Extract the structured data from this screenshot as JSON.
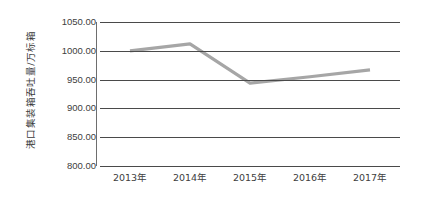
{
  "chart_data": {
    "type": "line",
    "title": "",
    "xlabel": "",
    "ylabel": "港口集装箱吞吐量/万标箱",
    "categories": [
      "2013年",
      "2014年",
      "2015年",
      "2016年",
      "2017年"
    ],
    "series": [
      {
        "name": "港口集装箱吞吐量",
        "values": [
          1000,
          1012,
          944,
          955,
          967
        ]
      }
    ],
    "ylim": [
      800,
      1050
    ],
    "ytick_labels": [
      "1050.00",
      "1000.00",
      "950.00",
      "900.00",
      "850.00",
      "800.00"
    ],
    "ytick_values": [
      1050,
      1000,
      950,
      900,
      850,
      800
    ],
    "grid": true,
    "legend": false,
    "legend_position": "none",
    "colors": {
      "line": "#a6a6a6",
      "gridline": "#4a4a4a",
      "axis": "#6e6e6e",
      "text": "#404040",
      "background": "#ffffff"
    }
  }
}
